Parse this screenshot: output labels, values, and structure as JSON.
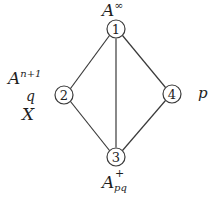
{
  "diagram": {
    "type": "lattice-graph",
    "colors": {
      "stroke": "#3a3a3a",
      "text": "#1e1e1e",
      "background": "#ffffff"
    },
    "nodes": [
      {
        "id": "1",
        "label": "1",
        "x": 116,
        "y": 29
      },
      {
        "id": "2",
        "label": "2",
        "x": 64,
        "y": 95
      },
      {
        "id": "3",
        "label": "3",
        "x": 116,
        "y": 157
      },
      {
        "id": "4",
        "label": "4",
        "x": 172,
        "y": 94
      }
    ],
    "edges": [
      {
        "from": "1",
        "to": "2"
      },
      {
        "from": "1",
        "to": "4"
      },
      {
        "from": "1",
        "to": "3"
      },
      {
        "from": "2",
        "to": "3"
      },
      {
        "from": "4",
        "to": "3"
      }
    ],
    "annotations": {
      "node1_top": {
        "base": "A",
        "sup": "∞"
      },
      "node2_upper": {
        "base": "A",
        "sup": "n+1"
      },
      "node2_q": "q",
      "node2_x": "X",
      "node4_p": "p",
      "node3_bottom": {
        "base": "A",
        "sup": "+",
        "sub": "pq"
      }
    }
  }
}
